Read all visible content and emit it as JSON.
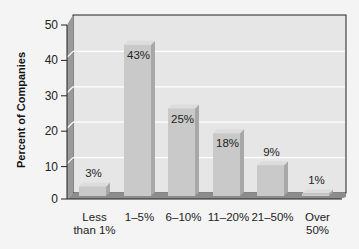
{
  "chart_data": {
    "type": "bar",
    "title": "",
    "xlabel": "",
    "ylabel": "Percent of Companies",
    "ylim": [
      0,
      50
    ],
    "yticks": [
      0,
      10,
      20,
      30,
      40,
      50
    ],
    "grid": true,
    "style": "3d",
    "categories": [
      "Less than 1%",
      "1–5%",
      "6–10%",
      "11–20%",
      "21–50%",
      "Over 50%"
    ],
    "category_lines": [
      [
        "Less",
        "than 1%"
      ],
      [
        "1–5%"
      ],
      [
        "6–10%"
      ],
      [
        "11–20%"
      ],
      [
        "21–50%"
      ],
      [
        "Over",
        "50%"
      ]
    ],
    "values": [
      3,
      43,
      25,
      18,
      9,
      1
    ],
    "value_labels": [
      "3%",
      "43%",
      "25%",
      "18%",
      "9%",
      "1%"
    ]
  },
  "colors": {
    "background": "#f4f4f4",
    "wall": "#e6e6e6",
    "wall_side": "#9a9a9a",
    "floor": "#8c8c8c",
    "bar_front": "#c9c9c9",
    "bar_side": "#a8a8a8",
    "bar_top": "#dcdcdc",
    "gridline": "#ffffff",
    "axis": "#222222"
  }
}
